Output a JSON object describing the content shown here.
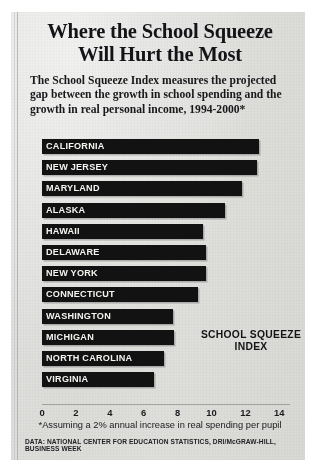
{
  "headline": {
    "line1": "Where the School Squeeze",
    "line2": "Will Hurt the Most"
  },
  "deck": "The School Squeeze Index measures the projected gap between the growth in school spending and the growth in real personal income, 1994-2000*",
  "callout": {
    "line1": "SCHOOL SQUEEZE",
    "line2": "INDEX"
  },
  "footnote": "*Assuming a 2% annual increase in real spending per pupil",
  "source": "DATA: NATIONAL CENTER FOR EDUCATION STATISTICS, DRI/McGRAW-HILL, BUSINESS WEEK",
  "chart_data": {
    "type": "bar",
    "orientation": "horizontal",
    "title": "Where the School Squeeze Will Hurt the Most",
    "subtitle": "The School Squeeze Index measures the projected gap between the growth in school spending and the growth in real personal income, 1994-2000*",
    "xlabel": "SCHOOL SQUEEZE INDEX",
    "ylabel": "",
    "xlim": [
      0,
      14
    ],
    "xticks": [
      0,
      2,
      4,
      6,
      8,
      10,
      12,
      14
    ],
    "grid": false,
    "legend": false,
    "bar_color": "#141414",
    "label_color": "#f2f2ee",
    "background_color": "#d9d9d6",
    "categories": [
      "CALIFORNIA",
      "NEW JERSEY",
      "MARYLAND",
      "ALASKA",
      "HAWAII",
      "DELAWARE",
      "NEW YORK",
      "CONNECTICUT",
      "WASHINGTON",
      "MICHIGAN",
      "NORTH CAROLINA",
      "VIRGINIA"
    ],
    "values": [
      12.8,
      12.7,
      11.8,
      10.8,
      9.5,
      9.7,
      9.7,
      9.2,
      7.7,
      7.8,
      7.2,
      6.6
    ],
    "bars": [
      {
        "label": "CALIFORNIA",
        "value": 12.8
      },
      {
        "label": "NEW JERSEY",
        "value": 12.7
      },
      {
        "label": "MARYLAND",
        "value": 11.8
      },
      {
        "label": "ALASKA",
        "value": 10.8
      },
      {
        "label": "HAWAII",
        "value": 9.5
      },
      {
        "label": "DELAWARE",
        "value": 9.7
      },
      {
        "label": "NEW YORK",
        "value": 9.7
      },
      {
        "label": "CONNECTICUT",
        "value": 9.2
      },
      {
        "label": "WASHINGTON",
        "value": 7.7
      },
      {
        "label": "MICHIGAN",
        "value": 7.8
      },
      {
        "label": "NORTH CAROLINA",
        "value": 7.2
      },
      {
        "label": "VIRGINIA",
        "value": 6.6
      }
    ]
  }
}
